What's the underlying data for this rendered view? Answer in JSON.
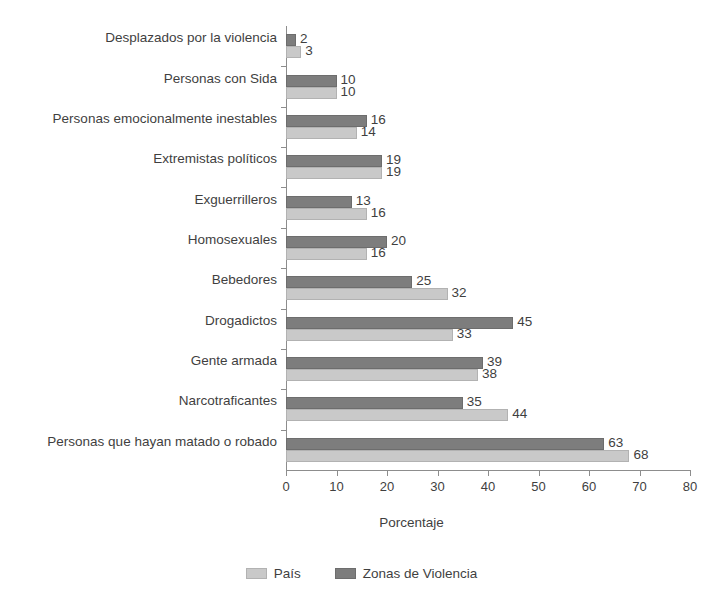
{
  "chart_data": {
    "type": "bar",
    "orientation": "horizontal",
    "title": "",
    "xlabel": "Porcentaje",
    "ylabel": "",
    "xlim": [
      0,
      80
    ],
    "xticks": [
      0,
      10,
      20,
      30,
      40,
      50,
      60,
      70,
      80
    ],
    "grid": false,
    "legend_position": "bottom",
    "categories": [
      "Desplazados por la violencia",
      "Personas con Sida",
      "Personas emocionalmente inestables",
      "Extremistas políticos",
      "Exguerrilleros",
      "Homosexuales",
      "Bebedores",
      "Drogadictos",
      "Gente armada",
      "Narcotraficantes",
      "Personas que hayan matado o robado"
    ],
    "series": [
      {
        "name": "Zonas de Violencia",
        "color": "#7d7d7d",
        "values": [
          2,
          10,
          16,
          19,
          13,
          20,
          25,
          45,
          39,
          35,
          63
        ]
      },
      {
        "name": "País",
        "color": "#c9c9c9",
        "values": [
          3,
          10,
          14,
          19,
          16,
          16,
          32,
          33,
          38,
          44,
          68
        ]
      }
    ]
  },
  "legend": {
    "items": [
      {
        "label": "País",
        "swatch": "light"
      },
      {
        "label": "Zonas de Violencia",
        "swatch": "dark"
      }
    ]
  }
}
